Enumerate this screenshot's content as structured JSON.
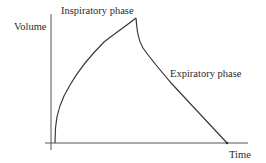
{
  "diagram": {
    "axes": {
      "y_label": "Volume",
      "x_label": "Time"
    },
    "annotations": {
      "inspiratory": "Inspiratory phase",
      "expiratory": "Expiratory phase"
    },
    "colors": {
      "line": "#3a3a3a",
      "axis": "#555555",
      "text": "#2a2a2a",
      "background": "#ffffff"
    }
  }
}
